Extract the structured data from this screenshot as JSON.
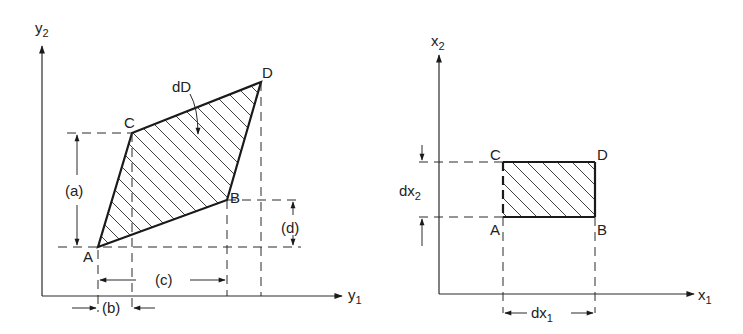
{
  "left_diagram": {
    "axes": {
      "vertical": "y",
      "vertical_sub": "2",
      "horizontal": "y",
      "horizontal_sub": "1"
    },
    "vertices": {
      "A": "A",
      "B": "B",
      "C": "C",
      "D": "D"
    },
    "region_label": "dD",
    "dimensions": {
      "a": "(a)",
      "b": "(b)",
      "c": "(c)",
      "d": "(d)"
    }
  },
  "right_diagram": {
    "axes": {
      "vertical": "x",
      "vertical_sub": "2",
      "horizontal": "x",
      "horizontal_sub": "1"
    },
    "vertices": {
      "A": "A",
      "B": "B",
      "C": "C",
      "D": "D"
    },
    "dimensions": {
      "dx1": "dx",
      "dx1_sub": "1",
      "dx2": "dx",
      "dx2_sub": "2"
    }
  },
  "colors": {
    "ink": "#1a1a1a",
    "background": "#ffffff"
  }
}
